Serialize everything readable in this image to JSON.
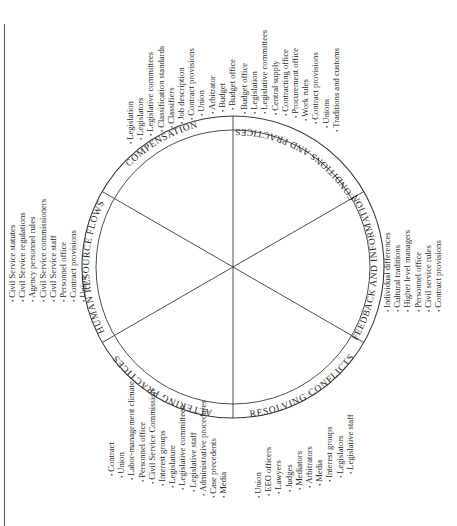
{
  "diagram": {
    "type": "wheel",
    "orientation": "rotated -90deg (reads bottom-to-top)",
    "segments": [
      {
        "id": "compensation",
        "label": "COMPENSATION"
      },
      {
        "id": "conditions",
        "label": "CONDITIONS AND PRACTICES"
      },
      {
        "id": "feedback",
        "label": "FEEDBACK AND INFORMATION"
      },
      {
        "id": "resolving",
        "label": "RESOLVING CONFLICTS"
      },
      {
        "id": "altering",
        "label": "ALTERING PRACTICES"
      },
      {
        "id": "hrflows",
        "label": "HUMAN RESOURCE FLOWS"
      }
    ]
  },
  "lists": {
    "compensation": [
      "Legislation",
      "Legislators",
      "Legislative committees",
      "Classification standards",
      "Classifiers",
      "Job description",
      "Contract provisions",
      "Union",
      "Arbitrator",
      "Budget",
      "Budget office"
    ],
    "conditions": [
      "Budget office",
      "Legislation",
      "Legislative committees",
      "Central supply",
      "Contracting office",
      "Procurement office",
      "Work rules",
      "Contract provisions",
      "Unions",
      "Traditions and customs"
    ],
    "feedback": [
      "Individual differences",
      "Cultural traditions",
      "Higher level managers",
      "Personnel office",
      "Civil service rules",
      "Contract provisions"
    ],
    "resolving": [
      "Union",
      "EEO officers",
      "Lawyers",
      "Judges",
      "Mediators",
      "Arbitrators",
      "Media",
      "Interest groups",
      "Legislators",
      "Legislative staff"
    ],
    "altering": [
      "Contract",
      "Union",
      "Labor-management climate",
      "Personnel office",
      "Civil Service Commission",
      "Interest groups",
      "Legislature",
      "Legislative committees",
      "Legislative staff",
      "Administrative procedures",
      "Case precedents",
      "Media"
    ],
    "hrflows": [
      "Civil Service statutes",
      "Civil Service regulations",
      "Agency personnel rules",
      "Civil Service commissioners",
      "Civil Service staff",
      "Personnel office",
      "Contract provisions",
      "Union"
    ]
  }
}
